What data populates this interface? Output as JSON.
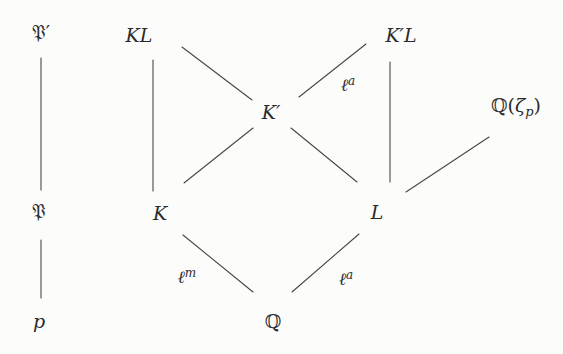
{
  "diagram_type": "field-extension-lattice",
  "nodes": {
    "P_frak_prime": {
      "label": "𝔓′"
    },
    "KL": {
      "label": "KL"
    },
    "K_prime_L": {
      "label": "K′L"
    },
    "K_prime": {
      "label": "K′"
    },
    "Q_zeta_p": {
      "pre": "ℚ(",
      "zeta": "ζ",
      "sub": "p",
      "post": ")"
    },
    "P_frak": {
      "label": "𝔓"
    },
    "K": {
      "label": "K"
    },
    "L": {
      "label": "L"
    },
    "p": {
      "label": "p"
    },
    "Q": {
      "label": "ℚ"
    }
  },
  "edge_labels": {
    "ell_a_top": {
      "base": "ℓ",
      "sup": "a"
    },
    "ell_m": {
      "base": "ℓ",
      "sup": "m"
    },
    "ell_a_bottom": {
      "base": "ℓ",
      "sup": "a"
    }
  },
  "edges": [
    {
      "from": "P_frak_prime",
      "to": "P_frak",
      "label": ""
    },
    {
      "from": "P_frak",
      "to": "p",
      "label": ""
    },
    {
      "from": "KL",
      "to": "K",
      "label": ""
    },
    {
      "from": "KL",
      "to": "K_prime",
      "label": ""
    },
    {
      "from": "K_prime_L",
      "to": "K_prime",
      "label": "ℓ^a"
    },
    {
      "from": "K_prime_L",
      "to": "L",
      "label": ""
    },
    {
      "from": "K_prime",
      "to": "K",
      "label": ""
    },
    {
      "from": "K_prime",
      "to": "L",
      "label": ""
    },
    {
      "from": "Q_zeta_p",
      "to": "L",
      "label": ""
    },
    {
      "from": "K",
      "to": "Q",
      "label": "ℓ^m"
    },
    {
      "from": "L",
      "to": "Q",
      "label": "ℓ^a"
    }
  ],
  "colors": {
    "bg": "#fcfcfb",
    "ink": "#2b2b2b",
    "line": "#474747"
  }
}
